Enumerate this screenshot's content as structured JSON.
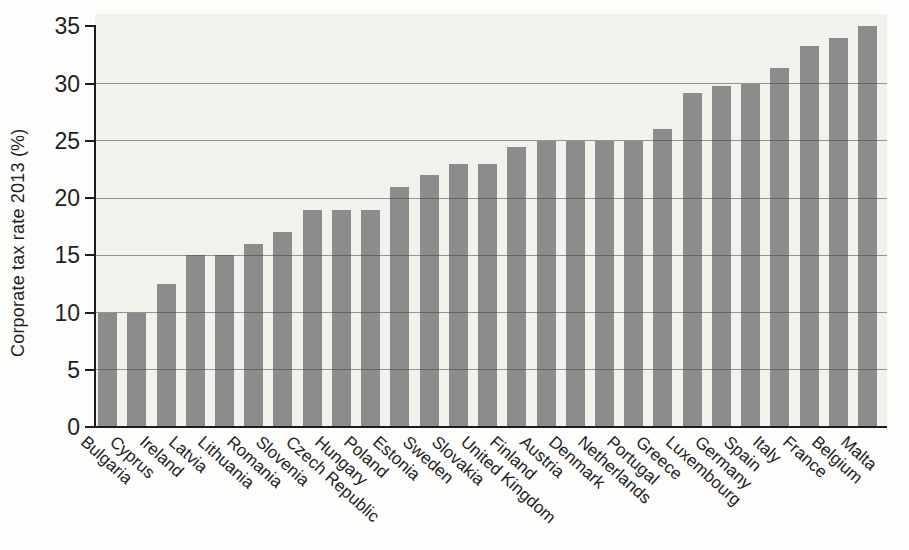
{
  "chart_data": {
    "type": "bar",
    "title": "",
    "xlabel": "",
    "ylabel": "Corporate tax rate 2013 (%)",
    "categories": [
      "Bulgaria",
      "Cyprus",
      "Ireland",
      "Latvia",
      "Lithuania",
      "Romania",
      "Slovenia",
      "Czech Republic",
      "Hungary",
      "Poland",
      "Estonia",
      "Sweden",
      "Slovakia",
      "United Kingdom",
      "Finland",
      "Austria",
      "Denmark",
      "Netherlands",
      "Portugal",
      "Greece",
      "Luxembourg",
      "Germany",
      "Spain",
      "Italy",
      "France",
      "Belgium",
      "Malta"
    ],
    "values": [
      10,
      10,
      12.5,
      15,
      15,
      16,
      17,
      19,
      19,
      19,
      21,
      22,
      23,
      23,
      24.5,
      25,
      25,
      25,
      25,
      26,
      29.2,
      29.8,
      30,
      31.4,
      33.3,
      34,
      35
    ],
    "ylim": [
      0,
      35
    ],
    "yticks": [
      0,
      5,
      10,
      15,
      20,
      25,
      30,
      35
    ],
    "grid": "horizontal-at-ticks-5-to-30",
    "legend": "none",
    "colors": {
      "bar": "#8c8c8c",
      "plot_background": "#f3f1ec",
      "gridline": "#6e6e6e",
      "axis": "#1c1c1c",
      "text": "#1f1f1f",
      "page_background": "#fdfdfc"
    }
  }
}
